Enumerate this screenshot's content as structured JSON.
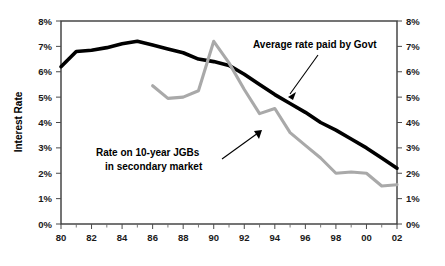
{
  "chart_data": {
    "type": "line",
    "title": "",
    "xlabel": "",
    "ylabel": "Interest Rate",
    "ylabel_right": "",
    "xlim": [
      80,
      102
    ],
    "ylim": [
      0,
      8
    ],
    "grid": false,
    "legend": "annotations",
    "y_tick_labels": [
      "0%",
      "1%",
      "2%",
      "3%",
      "4%",
      "5%",
      "6%",
      "7%",
      "8%"
    ],
    "y_tick_values": [
      0,
      1,
      2,
      3,
      4,
      5,
      6,
      7,
      8
    ],
    "y_tick_labels_right": [
      "0%",
      "1%",
      "2%",
      "3%",
      "4%",
      "5%",
      "6%",
      "7%",
      "8%"
    ],
    "x_tick_labels": [
      "80",
      "82",
      "84",
      "86",
      "88",
      "90",
      "92",
      "94",
      "96",
      "98",
      "00",
      "02"
    ],
    "x_tick_values": [
      80,
      82,
      84,
      86,
      88,
      90,
      92,
      94,
      96,
      98,
      100,
      102
    ],
    "x_minor_values": [
      81,
      83,
      85,
      87,
      89,
      91,
      93,
      95,
      97,
      99,
      101
    ],
    "series": [
      {
        "name": "Average rate paid by Govt",
        "color": "#000000",
        "x": [
          80,
          81,
          82,
          83,
          84,
          85,
          86,
          87,
          88,
          89,
          90,
          91,
          92,
          93,
          94,
          95,
          96,
          97,
          98,
          99,
          100,
          101,
          102
        ],
        "values": [
          6.2,
          6.8,
          6.85,
          6.95,
          7.1,
          7.2,
          7.05,
          6.9,
          6.75,
          6.5,
          6.4,
          6.25,
          5.9,
          5.5,
          5.1,
          4.75,
          4.4,
          4.0,
          3.7,
          3.35,
          3.0,
          2.6,
          2.2
        ]
      },
      {
        "name": "Rate on 10-year JGBs in secondary market",
        "color": "#a9a9a9",
        "x": [
          86,
          87,
          88,
          89,
          90,
          91,
          92,
          93,
          94,
          95,
          96,
          97,
          98,
          99,
          100,
          101,
          102
        ],
        "values": [
          5.45,
          4.95,
          5.0,
          5.25,
          7.2,
          6.35,
          5.3,
          4.35,
          4.55,
          3.6,
          3.1,
          2.6,
          2.0,
          2.05,
          2.0,
          1.5,
          1.55
        ]
      }
    ],
    "annotations": [
      {
        "text_lines": [
          "Average rate paid by Govt"
        ],
        "target_series": "Average rate paid by Govt",
        "target_x": 95,
        "target_y": 4.75
      },
      {
        "text_lines": [
          "Rate on 10-year JGBs",
          "in secondary market"
        ],
        "target_series": "Rate on 10-year JGBs in secondary market",
        "target_x": 95,
        "target_y": 3.6
      }
    ]
  },
  "axes": {
    "left_title": "Interest Rate",
    "y_labels": [
      "8%",
      "7%",
      "6%",
      "5%",
      "4%",
      "3%",
      "2%",
      "1%",
      "0%"
    ],
    "y_labels_right": [
      "8%",
      "7%",
      "6%",
      "5%",
      "4%",
      "3%",
      "2%",
      "1%",
      "0%"
    ],
    "x_labels": [
      "80",
      "82",
      "84",
      "86",
      "88",
      "90",
      "92",
      "94",
      "96",
      "98",
      "00",
      "02"
    ]
  },
  "annotations": {
    "govt_label": "Average rate paid by Govt",
    "jgb_label_line1": "Rate on 10-year JGBs",
    "jgb_label_line2": "in secondary market"
  },
  "colors": {
    "govt_series": "#000000",
    "jgb_series": "#a9a9a9",
    "frame": "#3a3a3a",
    "background": "#ffffff"
  }
}
